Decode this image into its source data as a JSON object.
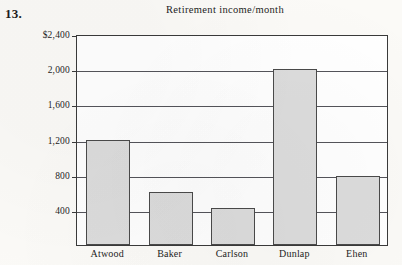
{
  "problem": {
    "number": "13."
  },
  "chart_data": {
    "type": "bar",
    "title": "Retirement income/month",
    "xlabel": "",
    "ylabel": "",
    "categories": [
      "Atwood",
      "Baker",
      "Carlson",
      "Dunlap",
      "Ehen"
    ],
    "values": [
      1200,
      600,
      420,
      2000,
      780
    ],
    "ylim": [
      0,
      2400
    ],
    "ytick_values": [
      2400,
      2000,
      1600,
      1200,
      800,
      400
    ],
    "ytick_labels": [
      "$2,400",
      "2,000",
      "1,600",
      "1,200",
      "800",
      "400"
    ],
    "grid": true,
    "legend": null,
    "bar_fill_color": "#dcdcdc",
    "bar_border_color": "#4a4a4a",
    "axis_color": "#3a3a3a",
    "background_color": "#fbfaf7"
  }
}
